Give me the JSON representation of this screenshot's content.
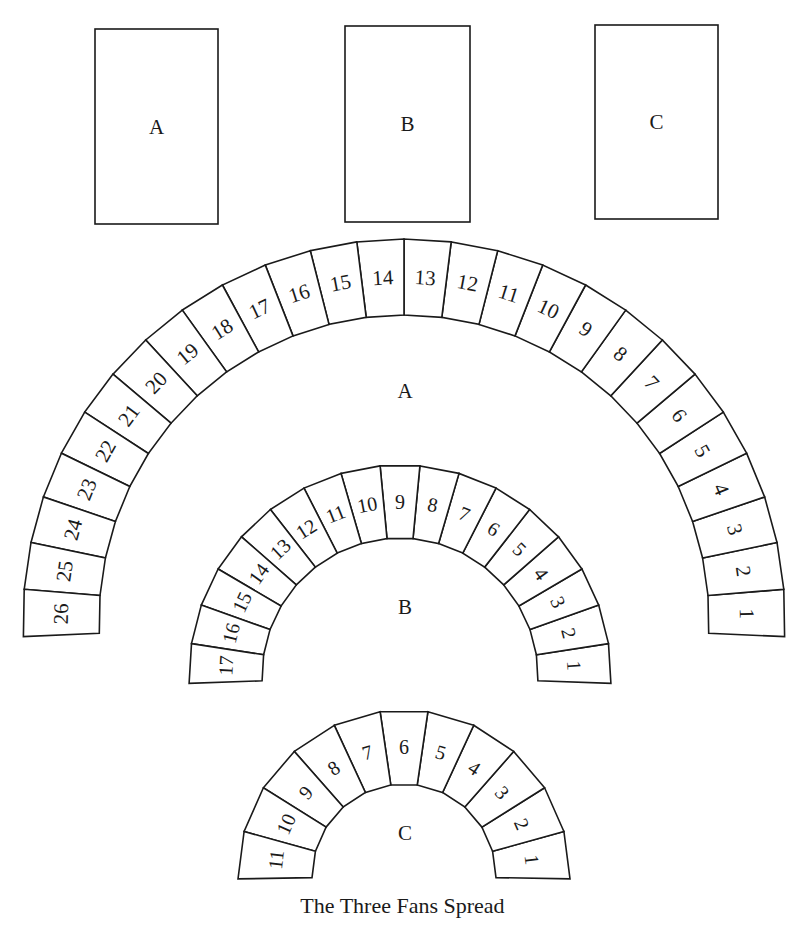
{
  "diagram": {
    "caption": "The Three Fans Spread",
    "stroke_color": "#1a1a1a",
    "background_color": "#ffffff",
    "cards": [
      {
        "label": "A",
        "x": 95,
        "y": 29,
        "w": 123,
        "h": 195
      },
      {
        "label": "B",
        "x": 345,
        "y": 26,
        "w": 125,
        "h": 196
      },
      {
        "label": "C",
        "x": 595,
        "y": 25,
        "w": 123,
        "h": 194
      }
    ],
    "fans": [
      {
        "label": "A",
        "count": 26,
        "cx": 404,
        "cy": 620,
        "r_outer": 381,
        "r_inner": 305,
        "start_deg": -2.5,
        "end_deg": 182.5,
        "label_pos": {
          "x": 405,
          "y": 398
        },
        "font_size": 21
      },
      {
        "label": "B",
        "count": 17,
        "cx": 400,
        "cy": 676,
        "r_outer": 211,
        "r_inner": 138,
        "start_deg": -2,
        "end_deg": 182,
        "label_pos": {
          "x": 405,
          "y": 614
        },
        "font_size": 20
      },
      {
        "label": "C",
        "count": 11,
        "cx": 404,
        "cy": 876,
        "r_outer": 166,
        "r_inner": 92,
        "start_deg": -1,
        "end_deg": 181,
        "label_pos": {
          "x": 405,
          "y": 840
        },
        "font_size": 20
      }
    ]
  }
}
